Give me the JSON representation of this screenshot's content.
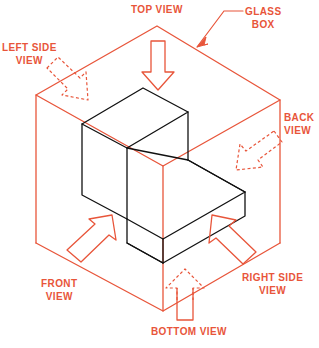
{
  "figure": {
    "colors": {
      "annotation": "#e8553a",
      "object_outline": "#000000",
      "background": "#ffffff"
    }
  },
  "labels": {
    "top_view": "TOP VIEW",
    "glass_box_line1": "GLASS",
    "glass_box_line2": "BOX",
    "left_side_line1": "LEFT SIDE",
    "left_side_line2": "VIEW",
    "back_line1": "BACK",
    "back_line2": "VIEW",
    "front_line1": "FRONT",
    "front_line2": "VIEW",
    "right_side_line1": "RIGHT SIDE",
    "right_side_line2": "VIEW",
    "bottom_view": "BOTTOM VIEW"
  },
  "geometry": {
    "glass_box": {
      "description": "Transparent isometric box enclosing the object",
      "top_back": "157,26",
      "top_left": "36,95",
      "top_right": "280,100",
      "top_front": "163,166",
      "bottom_left": "36,243",
      "bottom_right": "280,243",
      "bottom_front": "163,311"
    },
    "object": {
      "description": "L-shaped block (step block) drawn in black",
      "tall_top_left": "82,124",
      "tall_top_back": "143,88",
      "tall_top_right": "188,112",
      "tall_top_front": "104,146",
      "step_corner": "163,166",
      "slab_right": "245,192",
      "slab_front_bottom": "163,250"
    }
  },
  "arrows": [
    {
      "name": "top-view-arrow",
      "style": "solid",
      "direction": "down",
      "points_to": "top face"
    },
    {
      "name": "left-side-view-arrow",
      "style": "dashed",
      "direction": "down-right",
      "points_to": "left face"
    },
    {
      "name": "back-view-arrow",
      "style": "dashed",
      "direction": "down-left",
      "points_to": "back face"
    },
    {
      "name": "front-view-arrow",
      "style": "solid",
      "direction": "up-right",
      "points_to": "front face"
    },
    {
      "name": "right-side-view-arrow",
      "style": "solid",
      "direction": "up-left",
      "points_to": "right face"
    },
    {
      "name": "bottom-view-arrow",
      "style": "solid-dashed",
      "direction": "up",
      "points_to": "bottom face"
    }
  ]
}
